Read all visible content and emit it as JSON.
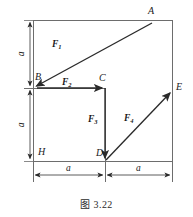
{
  "figure": {
    "caption": "图 3.22",
    "points": [
      {
        "id": "A",
        "label": "A",
        "x": 152,
        "y": 20
      },
      {
        "id": "B",
        "label": "B",
        "x": 40,
        "y": 88
      },
      {
        "id": "C",
        "label": "C",
        "x": 105,
        "y": 88
      },
      {
        "id": "D",
        "label": "D",
        "x": 105,
        "y": 161
      },
      {
        "id": "E",
        "label": "E",
        "x": 172,
        "y": 94
      },
      {
        "id": "H",
        "label": "H",
        "x": 40,
        "y": 161
      }
    ],
    "forces": [
      {
        "id": "F1",
        "label": "F",
        "sub": "1",
        "from": "A",
        "to": "B"
      },
      {
        "id": "F2",
        "label": "F",
        "sub": "2",
        "from": "B",
        "to": "C"
      },
      {
        "id": "F3",
        "label": "F",
        "sub": "3",
        "from": "C",
        "to": "D"
      },
      {
        "id": "F4",
        "label": "F",
        "sub": "4",
        "from": "D",
        "to": "E"
      }
    ],
    "dimensions": [
      {
        "id": "dim-left-upper",
        "label": "a",
        "orientation": "vertical",
        "from_y": 20,
        "to_y": 88
      },
      {
        "id": "dim-left-lower",
        "label": "a",
        "orientation": "vertical",
        "from_y": 88,
        "to_y": 161
      },
      {
        "id": "dim-bottom-left",
        "label": "a",
        "orientation": "horizontal",
        "from_x": 33,
        "to_x": 105
      },
      {
        "id": "dim-bottom-right",
        "label": "a",
        "orientation": "horizontal",
        "from_x": 105,
        "to_x": 172
      }
    ],
    "colors": {
      "line": "#6d6d6d",
      "vector": "#2a2a2a",
      "text": "#1a1a1a",
      "background": "#ffffff"
    }
  }
}
